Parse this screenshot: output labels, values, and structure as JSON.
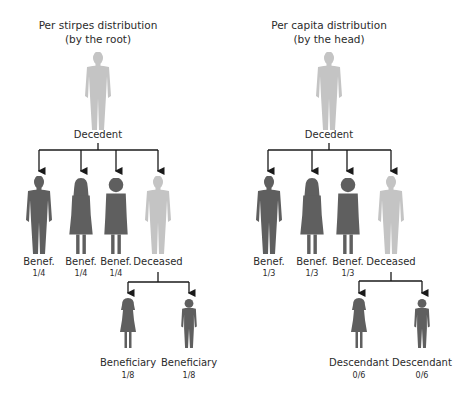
{
  "left_panel": {
    "title_line1": "Per stirpes distribution",
    "title_line2": "(by the root)",
    "root_label": "Decedent",
    "children": [
      {
        "label": "Benef.",
        "share": "1/4",
        "status": "beneficiary",
        "figure": "man"
      },
      {
        "label": "Benef.",
        "share": "1/4",
        "status": "beneficiary",
        "figure": "woman-long-hair"
      },
      {
        "label": "Benef.",
        "share": "1/4",
        "status": "beneficiary",
        "figure": "woman-short-hair"
      },
      {
        "label": "Deceased",
        "share": "",
        "status": "deceased",
        "figure": "man"
      }
    ],
    "grandchildren": [
      {
        "label": "Beneficiary",
        "share": "1/8",
        "figure": "girl"
      },
      {
        "label": "Beneficiary",
        "share": "1/8",
        "figure": "boy"
      }
    ]
  },
  "right_panel": {
    "title_line1": "Per capita distribution",
    "title_line2": "(by the head)",
    "root_label": "Decedent",
    "children": [
      {
        "label": "Benef.",
        "share": "1/3",
        "status": "beneficiary",
        "figure": "man"
      },
      {
        "label": "Benef.",
        "share": "1/3",
        "status": "beneficiary",
        "figure": "woman-long-hair"
      },
      {
        "label": "Benef.",
        "share": "1/3",
        "status": "beneficiary",
        "figure": "woman-short-hair"
      },
      {
        "label": "Deceased",
        "share": "",
        "status": "deceased",
        "figure": "man"
      }
    ],
    "grandchildren": [
      {
        "label": "Descendant",
        "share": "0/6",
        "figure": "girl"
      },
      {
        "label": "Descendant",
        "share": "0/6",
        "figure": "boy"
      }
    ]
  },
  "colors": {
    "beneficiary": "#5f5f5f",
    "deceased": "#c4c4c4",
    "lines": "#1a1a1a",
    "text": "#2b2b2b"
  }
}
